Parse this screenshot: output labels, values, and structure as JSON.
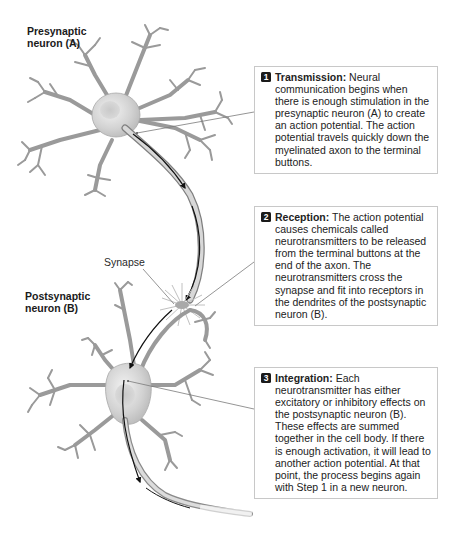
{
  "labels": {
    "presynaptic": "Presynaptic neuron (A)",
    "presynaptic_line1": "Presynaptic",
    "presynaptic_line2": "neuron (A)",
    "postsynaptic_line1": "Postsynaptic",
    "postsynaptic_line2": "neuron (B)",
    "synapse": "Synapse"
  },
  "callouts": [
    {
      "number": "1",
      "title": "Transmission:",
      "text": " Neural communication begins when there is enough stimulation in the presynaptic neuron (A) to create an action potential. The action potential travels quickly down the myelinated axon to the terminal buttons."
    },
    {
      "number": "2",
      "title": "Reception:",
      "text": " The action potential causes chemicals called neurotransmitters to be released from the terminal buttons at the end of the axon. The neurotransmitters cross the synapse and fit into receptors in the dendrites of the postsynaptic neuron (B)."
    },
    {
      "number": "3",
      "title": "Integration:",
      "text": " Each neurotransmitter has either excitatory or inhibitory effects on the postsynaptic neuron (B). These effects are summed together in the cell body. If there is enough activation, it will lead to another action potential. At that point, the process begins again with Step 1 in a new neuron."
    }
  ],
  "colors": {
    "neuron_fill": "#c4c4c4",
    "neuron_outline": "#8a8a8a",
    "arrow": "#111111",
    "box_border": "#c8c8c8",
    "badge": "#1a1a1a"
  }
}
